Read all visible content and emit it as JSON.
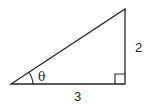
{
  "diagram": {
    "type": "right-triangle",
    "angle_label": "θ",
    "opposite_side_label": "2",
    "adjacent_side_label": "3",
    "right_angle_marker": true,
    "stroke_color": "#222222"
  }
}
